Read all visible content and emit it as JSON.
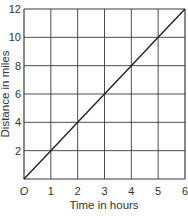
{
  "chart_data": {
    "type": "line",
    "title": "",
    "xlabel": "Time in hours",
    "ylabel": "Distance in miles",
    "xlim": [
      0,
      6
    ],
    "ylim": [
      0,
      12
    ],
    "grid": true,
    "x_ticks": [
      "O",
      "1",
      "2",
      "3",
      "4",
      "5",
      "6"
    ],
    "y_ticks": [
      "2",
      "4",
      "6",
      "8",
      "10",
      "12"
    ],
    "series": [
      {
        "name": "Distance",
        "x": [
          0,
          1,
          2,
          3,
          4,
          5,
          6
        ],
        "y": [
          0,
          2,
          4,
          6,
          8,
          10,
          12
        ]
      }
    ],
    "colors": {
      "grid": "#3a3a3a",
      "line": "#222222",
      "text": "#333333"
    }
  }
}
